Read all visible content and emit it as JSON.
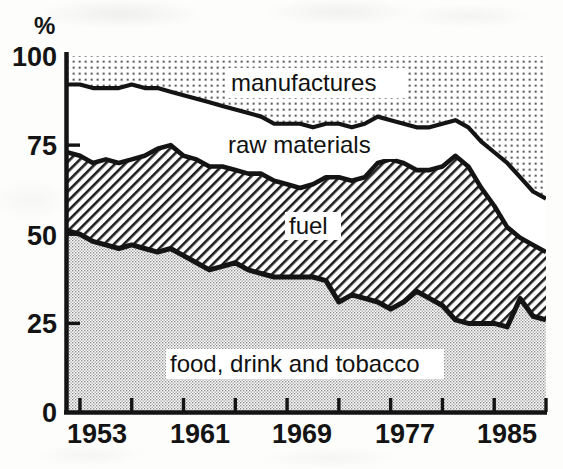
{
  "figure": {
    "kind": "stacked-area-chart",
    "y_axis_unit_label": "%",
    "y_ticks": [
      "0",
      "25",
      "50",
      "75",
      "100"
    ],
    "x_ticks": [
      "1953",
      "1961",
      "1969",
      "1977",
      "1985"
    ],
    "series_labels": {
      "manufactures": "manufactures",
      "raw_materials": "raw materials",
      "fuel": "fuel",
      "food": "food, drink and tobacco"
    },
    "colors": {
      "ink": "#141414",
      "manufactures_fill": "#e9e9e9",
      "raw_materials_fill": "#ffffff",
      "fuel_fill": "#d9d9d9",
      "food_fill": "#dcdcdc"
    }
  },
  "chart_data": {
    "type": "area",
    "title": "",
    "xlabel": "",
    "ylabel": "%",
    "xlim": [
      1953,
      1990
    ],
    "ylim": [
      0,
      100
    ],
    "grid": false,
    "legend": "inline-labels",
    "stacked": true,
    "note": "Shares of UK imports by commodity group; bands stack to 100%. Values are cumulative upper boundaries read off the plotted curves.",
    "x": [
      1953,
      1954,
      1955,
      1956,
      1957,
      1958,
      1959,
      1960,
      1961,
      1962,
      1963,
      1964,
      1965,
      1966,
      1967,
      1968,
      1969,
      1970,
      1971,
      1972,
      1973,
      1974,
      1975,
      1976,
      1977,
      1978,
      1979,
      1980,
      1981,
      1982,
      1983,
      1984,
      1985,
      1986,
      1987,
      1988,
      1989,
      1990
    ],
    "boundaries": {
      "food_top": [
        51,
        50,
        48,
        47,
        46,
        47,
        46,
        45,
        46,
        44,
        42,
        40,
        41,
        42,
        40,
        39,
        38,
        38,
        38,
        38,
        37,
        31,
        33,
        32,
        31,
        29,
        31,
        34,
        32,
        30,
        26,
        25,
        25,
        25,
        24,
        32,
        27,
        26
      ],
      "fuel_top": [
        73,
        72,
        70,
        71,
        70,
        71,
        72,
        74,
        75,
        72,
        71,
        69,
        69,
        68,
        67,
        67,
        65,
        64,
        63,
        64,
        66,
        66,
        65,
        66,
        70,
        71,
        70,
        68,
        68,
        69,
        72,
        69,
        63,
        58,
        52,
        49,
        47,
        45
      ],
      "manufactures_top": [
        92,
        92,
        91,
        91,
        91,
        92,
        91,
        91,
        90,
        89,
        88,
        87,
        86,
        85,
        84,
        83,
        81,
        81,
        81,
        80,
        81,
        81,
        80,
        81,
        83,
        82,
        81,
        80,
        80,
        81,
        82,
        80,
        76,
        73,
        70,
        66,
        62,
        60
      ]
    },
    "series": [
      {
        "name": "food, drink and tobacco",
        "values": [
          51,
          50,
          48,
          47,
          46,
          47,
          46,
          45,
          46,
          44,
          42,
          40,
          41,
          42,
          40,
          39,
          38,
          38,
          38,
          38,
          37,
          31,
          33,
          32,
          31,
          29,
          31,
          34,
          32,
          30,
          26,
          25,
          25,
          25,
          24,
          32,
          27,
          26
        ]
      },
      {
        "name": "fuel",
        "values": [
          22,
          22,
          22,
          24,
          24,
          24,
          26,
          29,
          29,
          28,
          29,
          29,
          28,
          26,
          27,
          28,
          27,
          26,
          25,
          26,
          29,
          35,
          32,
          34,
          39,
          42,
          39,
          34,
          36,
          39,
          46,
          44,
          38,
          33,
          28,
          17,
          20,
          19
        ]
      },
      {
        "name": "raw materials",
        "values": [
          19,
          20,
          21,
          20,
          21,
          21,
          19,
          17,
          15,
          17,
          17,
          18,
          17,
          17,
          17,
          16,
          16,
          17,
          18,
          16,
          15,
          15,
          15,
          15,
          13,
          11,
          11,
          12,
          12,
          12,
          10,
          11,
          13,
          15,
          18,
          17,
          15,
          15
        ]
      },
      {
        "name": "manufactures",
        "values": [
          8,
          8,
          9,
          9,
          9,
          8,
          9,
          9,
          10,
          11,
          12,
          13,
          14,
          15,
          16,
          17,
          19,
          19,
          19,
          20,
          19,
          19,
          20,
          19,
          17,
          18,
          19,
          20,
          20,
          19,
          18,
          20,
          24,
          27,
          30,
          34,
          38,
          40
        ]
      }
    ]
  }
}
